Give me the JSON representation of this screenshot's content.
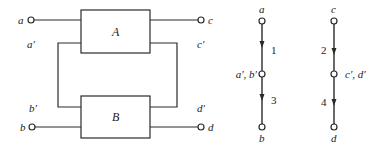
{
  "circuit": {
    "boxes": [
      {
        "id": "A",
        "label": "A"
      },
      {
        "id": "B",
        "label": "B"
      }
    ],
    "terminals": {
      "a": "a",
      "a_prime": "a′",
      "b": "b",
      "b_prime": "b′",
      "c": "c",
      "c_prime": "c′",
      "d": "d",
      "d_prime": "d′"
    }
  },
  "graph_left": {
    "nodes": {
      "top": "a",
      "middle": "a′, b′",
      "bottom": "b"
    },
    "edges": [
      {
        "label": "1",
        "from": "a",
        "to": "a′, b′"
      },
      {
        "label": "3",
        "from": "a′, b′",
        "to": "b"
      }
    ]
  },
  "graph_right": {
    "nodes": {
      "top": "c",
      "middle": "c′, d′",
      "bottom": "d"
    },
    "edges": [
      {
        "label": "2",
        "from": "c",
        "to": "c′, d′"
      },
      {
        "label": "4",
        "from": "c′, d′",
        "to": "d"
      }
    ]
  }
}
